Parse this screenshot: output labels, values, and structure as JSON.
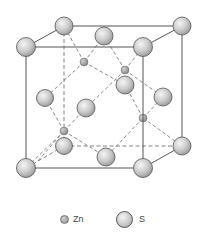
{
  "legend": {
    "zn_label": "Zn",
    "s_label": "S"
  },
  "colors": {
    "s_atom": "#c9c9c9",
    "zn_atom": "#9a9a9a",
    "edge": "#555555",
    "dashed_bond": "#777777"
  },
  "structure": {
    "front_corners": [
      [
        26,
        47
      ],
      [
        143,
        47
      ],
      [
        26,
        168
      ],
      [
        143,
        168
      ]
    ],
    "back_corners": [
      [
        64,
        26
      ],
      [
        182,
        26
      ],
      [
        64,
        146
      ],
      [
        182,
        146
      ]
    ],
    "s_face_centers": [
      [
        104,
        36
      ],
      [
        125,
        85
      ],
      [
        86,
        108
      ],
      [
        45,
        98
      ],
      [
        163,
        97
      ],
      [
        106,
        157
      ]
    ],
    "zn_sites": [
      [
        84,
        62
      ],
      [
        125,
        70
      ],
      [
        64,
        131
      ],
      [
        143,
        118
      ]
    ]
  }
}
